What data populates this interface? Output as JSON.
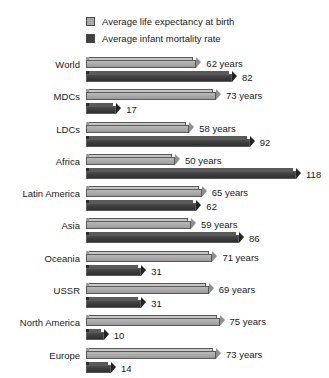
{
  "chart_data": {
    "type": "bar",
    "orientation": "horizontal",
    "title": "",
    "subtitle": "",
    "xlabel": "",
    "ylabel": "",
    "grid": false,
    "legend_position": "top",
    "xlim": [
      0,
      120
    ],
    "categories": [
      "World",
      "MDCs",
      "LDCs",
      "Africa",
      "Latin America",
      "Asia",
      "Oceania",
      "USSR",
      "North America",
      "Europe"
    ],
    "series": [
      {
        "name": "Average life expectancy at birth",
        "color": "#a8a8a8",
        "values": [
          62,
          73,
          58,
          50,
          65,
          59,
          71,
          69,
          75,
          73
        ],
        "labels": [
          "62 years",
          "73 years",
          "58 years",
          "50 years",
          "65 years",
          "59 years",
          "71 years",
          "69 years",
          "75 years",
          "73 years"
        ]
      },
      {
        "name": "Average infant mortality rate",
        "color": "#404040",
        "values": [
          82,
          17,
          92,
          118,
          62,
          86,
          31,
          31,
          10,
          14
        ],
        "labels": [
          "82",
          "17",
          "92",
          "118",
          "62",
          "86",
          "31",
          "31",
          "10",
          "14"
        ]
      }
    ]
  },
  "legend": {
    "items": [
      {
        "label": "Average life expectancy at birth",
        "swatch": "light-gray-swatch-icon"
      },
      {
        "label": "Average infant mortality rate",
        "swatch": "dark-gray-swatch-icon"
      }
    ]
  }
}
